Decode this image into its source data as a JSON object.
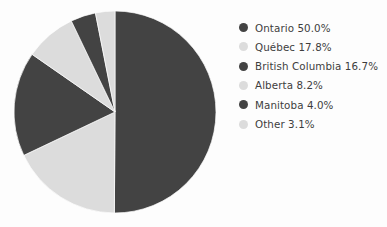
{
  "chart_data": {
    "type": "pie",
    "title": "",
    "labels": [
      "Ontario",
      "Québec",
      "British Columbia",
      "Alberta",
      "Manitoba",
      "Other"
    ],
    "values": [
      50.0,
      17.8,
      16.7,
      8.2,
      4.0,
      3.1
    ],
    "value_unit": "%",
    "start_angle_deg": 90,
    "direction": "clockwise",
    "legend_position": "right",
    "grid": false,
    "colors": [
      "#434343",
      "#dcdcdc",
      "#434343",
      "#dcdcdc",
      "#434343",
      "#dcdcdc"
    ],
    "background": "#fdfdfd",
    "text_color": "#3d3d3d",
    "slices": [
      {
        "label": "Ontario",
        "value": 50.0,
        "color": "#434343",
        "legend_text": "Ontario 50.0%"
      },
      {
        "label": "Québec",
        "value": 17.8,
        "color": "#dcdcdc",
        "legend_text": "Québec 17.8%"
      },
      {
        "label": "British Columbia",
        "value": 16.7,
        "color": "#434343",
        "legend_text": "British Columbia 16.7%"
      },
      {
        "label": "Alberta",
        "value": 8.2,
        "color": "#dcdcdc",
        "legend_text": "Alberta 8.2%"
      },
      {
        "label": "Manitoba",
        "value": 4.0,
        "color": "#434343",
        "legend_text": "Manitoba 4.0%"
      },
      {
        "label": "Other",
        "value": 3.1,
        "color": "#dcdcdc",
        "legend_text": "Other 3.1%"
      }
    ]
  },
  "legend": {
    "items": [
      {
        "text": "Ontario 50.0%"
      },
      {
        "text": "Québec 17.8%"
      },
      {
        "text": "British Columbia 16.7%"
      },
      {
        "text": "Alberta 8.2%"
      },
      {
        "text": "Manitoba 4.0%"
      },
      {
        "text": "Other 3.1%"
      }
    ]
  }
}
